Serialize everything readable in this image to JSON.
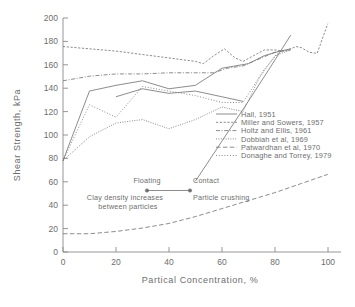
{
  "chart_data": {
    "type": "line",
    "title": "",
    "xlabel": "Partical Concentration, %",
    "ylabel": "Shear Strength, kPa",
    "xlim": [
      0,
      105
    ],
    "ylim": [
      0,
      205
    ],
    "xticks": [
      "0",
      "20",
      "40",
      "60",
      "80",
      "100"
    ],
    "xtick_values": [
      0,
      20,
      40,
      60,
      80,
      100
    ],
    "yticks": [
      "0",
      "20",
      "40",
      "60",
      "80",
      "100",
      "120",
      "140",
      "160",
      "180",
      "200"
    ],
    "ytick_values": [
      0,
      20,
      40,
      60,
      80,
      100,
      120,
      140,
      160,
      180,
      200
    ],
    "grid": false,
    "legend_position": "center-right",
    "series": [
      {
        "name": "Hall, 1951",
        "style": "solid",
        "x": [
          50,
          60,
          70,
          80,
          86
        ],
        "y": [
          62,
          97,
          132,
          168,
          190
        ]
      },
      {
        "name": "Miller and Sowers, 1957",
        "style": "dashed-fine",
        "x": [
          0,
          10,
          20,
          30,
          40,
          50,
          53,
          57,
          61,
          65,
          68,
          72,
          76,
          80,
          84,
          88,
          90,
          93,
          96,
          100
        ],
        "y": [
          180,
          178,
          176,
          173,
          170,
          167,
          165,
          172,
          178,
          170,
          167,
          172,
          177,
          177,
          176,
          180,
          179,
          175,
          174,
          200
        ]
      },
      {
        "name": "Holtz and Ellis, 1961",
        "style": "dash-dot",
        "x": [
          0,
          10,
          20,
          30,
          40,
          50,
          57,
          62,
          68,
          74,
          80,
          86
        ],
        "y": [
          150,
          154,
          156,
          156,
          157,
          157,
          157,
          161,
          163,
          169,
          175,
          177
        ]
      },
      {
        "name": "Dobbiah et al, 1969",
        "style": "dotted",
        "x": [
          0,
          10,
          20,
          30,
          40,
          50,
          60,
          68,
          74,
          80,
          86
        ],
        "y": [
          80,
          101,
          113,
          116,
          108,
          116,
          127,
          123,
          152,
          172,
          177
        ]
      },
      {
        "name": "Patwardhan et al, 1970",
        "style": "dashed-long",
        "x": [
          0,
          10,
          20,
          30,
          40,
          50,
          60,
          70,
          80,
          90,
          100
        ],
        "y": [
          16,
          16,
          18,
          21,
          25,
          31,
          38,
          45,
          52,
          60,
          68
        ]
      },
      {
        "name": "Donaghe and Torrey, 1979",
        "style": "dotted-fine",
        "x": [
          0,
          10,
          20,
          30,
          40,
          50,
          60,
          68,
          76,
          82
        ],
        "y": [
          80,
          129,
          118,
          145,
          141,
          137,
          131,
          131,
          160,
          176
        ]
      },
      {
        "name": "unlabeled-upper",
        "style": "solid-thin",
        "x": [
          0,
          10,
          20,
          30,
          40,
          50,
          60,
          70,
          76,
          82,
          86
        ],
        "y": [
          80,
          141,
          146,
          150,
          143,
          146,
          161,
          165,
          172,
          176,
          178
        ]
      },
      {
        "name": "unlabeled-mid",
        "style": "solid-thin",
        "x": [
          20,
          30,
          40,
          50,
          60,
          68
        ],
        "y": [
          136,
          143,
          139,
          141,
          136,
          132
        ]
      }
    ]
  },
  "legend": {
    "items": [
      {
        "label": "Hall, 1951",
        "style": "solid"
      },
      {
        "label": "Miller and Sowers, 1957",
        "style": "dashed-fine"
      },
      {
        "label": "Holtz and Ellis, 1961",
        "style": "dash-dot"
      },
      {
        "label": "Dobbiah et al, 1969",
        "style": "dotted"
      },
      {
        "label": "Patwardhan et al, 1970",
        "style": "dashed-long"
      },
      {
        "label": "Donaghe and Torrey, 1979",
        "style": "dotted-fine"
      }
    ]
  },
  "annotations": {
    "floating": "Floating",
    "contact": "Contact",
    "clay_line1": "Clay density increases",
    "clay_line2": "between particles",
    "particle_crushing": "Particle crushing"
  },
  "colors": {
    "background": "#ffffff",
    "axis": "#8a8a8a",
    "text": "#6e6e6e",
    "series": "#777777"
  }
}
